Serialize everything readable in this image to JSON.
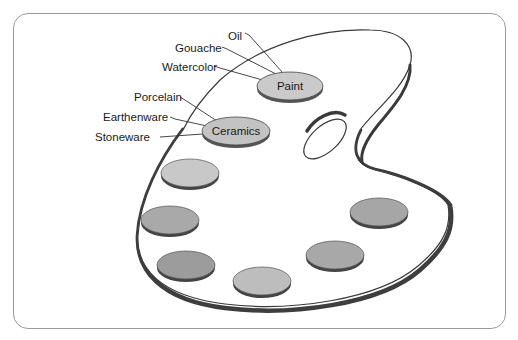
{
  "diagram": {
    "colors": {
      "frame_border": "#9a9a9a",
      "palette_outline": "#3a3a3a",
      "palette_shadow": "#4a4a4a",
      "node_fill": "#c9c9c9",
      "well_light": "#c6c6c6",
      "well_mid": "#a9a9a9",
      "well_dark": "#9a9a9a"
    },
    "nodes": [
      {
        "id": "paint",
        "label": "Paint",
        "children": [
          "Oil",
          "Gouache",
          "Watercolor"
        ]
      },
      {
        "id": "ceramics",
        "label": "Ceramics",
        "children": [
          "Porcelain",
          "Earthenware",
          "Stoneware"
        ]
      }
    ],
    "labels": {
      "oil": "Oil",
      "gouache": "Gouache",
      "watercolor": "Watercolor",
      "porcelain": "Porcelain",
      "earthenware": "Earthenware",
      "stoneware": "Stoneware",
      "paint": "Paint",
      "ceramics": "Ceramics"
    },
    "wells": [
      {
        "position": "upper-left",
        "shade": "light"
      },
      {
        "position": "left",
        "shade": "mid"
      },
      {
        "position": "lower-left",
        "shade": "dark"
      },
      {
        "position": "bottom",
        "shade": "light"
      },
      {
        "position": "lower-right",
        "shade": "mid"
      },
      {
        "position": "right",
        "shade": "mid"
      }
    ]
  }
}
